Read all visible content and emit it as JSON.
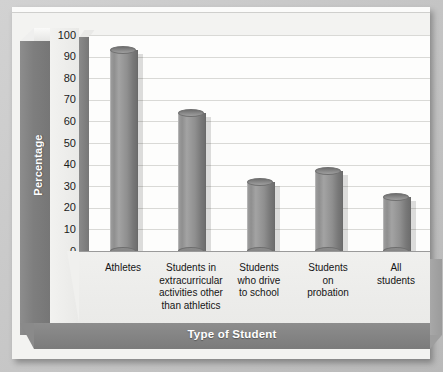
{
  "chart_data": {
    "type": "bar",
    "title": "",
    "xlabel": "Type of Student",
    "ylabel": "Percentage",
    "categories": [
      "Athletes",
      "Students in extracurricular activities other than athletics",
      "Students who drive to school",
      "Students on probation",
      "All students"
    ],
    "category_lines": [
      [
        "Athletes"
      ],
      [
        "Students in",
        "extracurricular",
        "activities other",
        "than athletics"
      ],
      [
        "Students",
        "who drive",
        "to school"
      ],
      [
        "Students",
        "on",
        "probation"
      ],
      [
        "All",
        "students"
      ]
    ],
    "values": [
      93,
      64,
      32,
      37,
      25
    ],
    "ylim": [
      0,
      100
    ],
    "ytick_labels": [
      "100",
      "90",
      "80",
      "70",
      "60",
      "50",
      "40",
      "30",
      "20",
      "10",
      "0"
    ],
    "ytick_values": [
      100,
      90,
      80,
      70,
      60,
      50,
      40,
      30,
      20,
      10,
      0
    ],
    "grid": true,
    "legend": "none",
    "style": "3d-cylinder",
    "colors": {
      "bar": "#8f8f8f",
      "plot_background": "#fdfdfc",
      "gridline": "#d9d9d6",
      "wall": "#7e7e7e",
      "floor": "#efefed",
      "axis_title_text": "#ffffff",
      "tick_text": "#1b1b1b",
      "page_background": "#c9c9c9",
      "sheet": "#f3f3f1"
    }
  }
}
